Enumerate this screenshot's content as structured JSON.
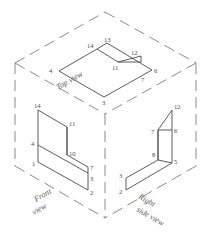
{
  "drawing": {
    "title": "Isometric box with three orthographic views",
    "line_color": "#4a4a4a",
    "dash_color": "#8a8a8a",
    "background": "#ffffff"
  },
  "captions": {
    "top": "Top view",
    "front_line1": "Front",
    "front_line2": "view",
    "right_line1": "Right",
    "right_line2": "side  view"
  },
  "top_view": {
    "name": "Top view",
    "vertex_labels": [
      "14",
      "13",
      "12",
      "11",
      "4",
      "6",
      "7",
      "3"
    ],
    "labels": {
      "l14": "14",
      "l13": "13",
      "l12": "12",
      "l11": "11",
      "l4": "4",
      "l6": "6",
      "l7": "7",
      "l3": "3"
    }
  },
  "front_view": {
    "name": "Front view",
    "vertex_labels": [
      "14",
      "11",
      "4",
      "10",
      "1",
      "7",
      "3",
      "2"
    ],
    "labels": {
      "l14": "14",
      "l11": "11",
      "l4": "4",
      "l10": "10",
      "l1": "1",
      "l7": "7",
      "l3": "3",
      "l2": "2"
    }
  },
  "right_view": {
    "name": "Right side view",
    "vertex_labels": [
      "12",
      "6",
      "7",
      "8",
      "5",
      "3",
      "2"
    ],
    "labels": {
      "l12": "12",
      "l6": "6",
      "l7": "7",
      "l8": "8",
      "l5": "5",
      "l3": "3",
      "l2": "2"
    }
  }
}
